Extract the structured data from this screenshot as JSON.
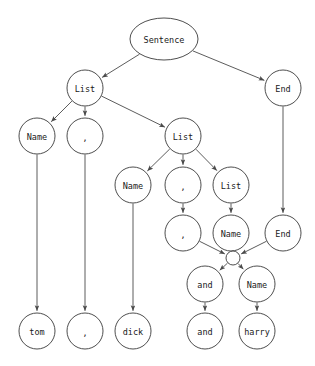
{
  "diagram": {
    "width": 315,
    "height": 366,
    "node_stroke_color": "#3a3a3a",
    "edge_color": "#4a4a4a",
    "label_color": "#1a1a1a",
    "background": "#ffffff",
    "nodes": [
      {
        "id": "sentence",
        "label": "Sentence",
        "x": 164,
        "y": 39,
        "shape": "ellipse",
        "rx": 34,
        "ry": 21,
        "font_size": 8.5
      },
      {
        "id": "list1",
        "label": "List",
        "x": 85,
        "y": 88,
        "shape": "circle",
        "rx": 18,
        "ry": 18,
        "font_size": 8.5
      },
      {
        "id": "end1",
        "label": "End",
        "x": 283,
        "y": 88,
        "shape": "circle",
        "rx": 18,
        "ry": 18,
        "font_size": 8.5
      },
      {
        "id": "name1",
        "label": "Name",
        "x": 37,
        "y": 136,
        "shape": "circle",
        "rx": 18,
        "ry": 18,
        "font_size": 8.5
      },
      {
        "id": "comma1",
        "label": ",",
        "x": 85,
        "y": 136,
        "shape": "circle",
        "rx": 18,
        "ry": 18,
        "font_size": 8.5
      },
      {
        "id": "list2",
        "label": "List",
        "x": 183,
        "y": 136,
        "shape": "circle",
        "rx": 18,
        "ry": 18,
        "font_size": 8.5
      },
      {
        "id": "name2",
        "label": "Name",
        "x": 133,
        "y": 185,
        "shape": "circle",
        "rx": 18,
        "ry": 18,
        "font_size": 8.5
      },
      {
        "id": "comma2",
        "label": ",",
        "x": 183,
        "y": 185,
        "shape": "circle",
        "rx": 18,
        "ry": 18,
        "font_size": 8.5
      },
      {
        "id": "list3",
        "label": "List",
        "x": 231,
        "y": 185,
        "shape": "circle",
        "rx": 18,
        "ry": 18,
        "font_size": 8.5
      },
      {
        "id": "comma3",
        "label": ",",
        "x": 183,
        "y": 233,
        "shape": "circle",
        "rx": 18,
        "ry": 18,
        "font_size": 8.5
      },
      {
        "id": "name3",
        "label": "Name",
        "x": 231,
        "y": 233,
        "shape": "circle",
        "rx": 18,
        "ry": 18,
        "font_size": 8.5
      },
      {
        "id": "end2",
        "label": "End",
        "x": 283,
        "y": 233,
        "shape": "circle",
        "rx": 18,
        "ry": 18,
        "font_size": 8.5
      },
      {
        "id": "junction",
        "label": "",
        "x": 233,
        "y": 258,
        "shape": "circle",
        "rx": 7,
        "ry": 7,
        "font_size": 7
      },
      {
        "id": "and1",
        "label": "and",
        "x": 205,
        "y": 284,
        "shape": "circle",
        "rx": 18,
        "ry": 18,
        "font_size": 8.5
      },
      {
        "id": "name4",
        "label": "Name",
        "x": 257,
        "y": 284,
        "shape": "circle",
        "rx": 18,
        "ry": 18,
        "font_size": 8.5
      },
      {
        "id": "tom",
        "label": "tom",
        "x": 37,
        "y": 331,
        "shape": "circle",
        "rx": 18,
        "ry": 18,
        "font_size": 8.5
      },
      {
        "id": "commaleaf",
        "label": ",",
        "x": 85,
        "y": 331,
        "shape": "circle",
        "rx": 18,
        "ry": 18,
        "font_size": 8.5
      },
      {
        "id": "dick",
        "label": "dick",
        "x": 133,
        "y": 331,
        "shape": "circle",
        "rx": 18,
        "ry": 18,
        "font_size": 8.5
      },
      {
        "id": "andleaf",
        "label": "and",
        "x": 205,
        "y": 331,
        "shape": "circle",
        "rx": 18,
        "ry": 18,
        "font_size": 8.5
      },
      {
        "id": "harry",
        "label": "harry",
        "x": 257,
        "y": 331,
        "shape": "circle",
        "rx": 18,
        "ry": 18,
        "font_size": 8.5
      }
    ],
    "edges": [
      {
        "from": "sentence",
        "to": "list1"
      },
      {
        "from": "sentence",
        "to": "end1"
      },
      {
        "from": "list1",
        "to": "name1"
      },
      {
        "from": "list1",
        "to": "comma1"
      },
      {
        "from": "list1",
        "to": "list2"
      },
      {
        "from": "list2",
        "to": "name2"
      },
      {
        "from": "list2",
        "to": "comma2"
      },
      {
        "from": "list2",
        "to": "list3"
      },
      {
        "from": "comma2",
        "to": "comma3"
      },
      {
        "from": "list3",
        "to": "name3"
      },
      {
        "from": "end1",
        "to": "end2"
      },
      {
        "from": "comma3",
        "to": "junction"
      },
      {
        "from": "name3",
        "to": "junction"
      },
      {
        "from": "end2",
        "to": "junction"
      },
      {
        "from": "junction",
        "to": "and1"
      },
      {
        "from": "junction",
        "to": "name4"
      },
      {
        "from": "name1",
        "to": "tom"
      },
      {
        "from": "comma1",
        "to": "commaleaf"
      },
      {
        "from": "name2",
        "to": "dick"
      },
      {
        "from": "and1",
        "to": "andleaf"
      },
      {
        "from": "name4",
        "to": "harry"
      }
    ]
  }
}
